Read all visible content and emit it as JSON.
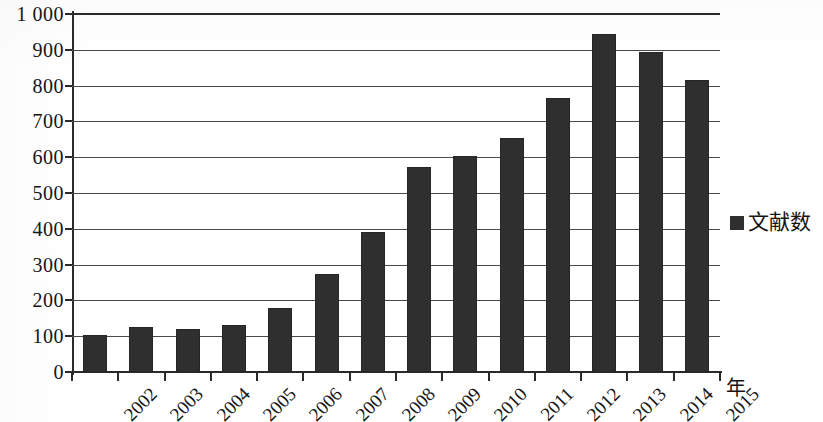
{
  "chart_data": {
    "type": "bar",
    "title": "",
    "subtitle": "",
    "xlabel": "年",
    "ylabel": "",
    "categories": [
      "2002",
      "2003",
      "2004",
      "2005",
      "2006",
      "2007",
      "2008",
      "2009",
      "2010",
      "2011",
      "2012",
      "2013",
      "2014",
      "2015"
    ],
    "values": [
      103,
      127,
      120,
      132,
      180,
      274,
      392,
      574,
      602,
      653,
      765,
      945,
      893,
      815
    ],
    "series": [
      {
        "name": "文献数",
        "values": [
          103,
          127,
          120,
          132,
          180,
          274,
          392,
          574,
          602,
          653,
          765,
          945,
          893,
          815
        ],
        "color": "#302f2f"
      }
    ],
    "ylim": [
      0,
      1000
    ],
    "ytick_step": 100,
    "ytick_labels": [
      "1 000",
      "900",
      "800",
      "700",
      "600",
      "500",
      "400",
      "300",
      "200",
      "100",
      "0"
    ],
    "ytick_values": [
      1000,
      900,
      800,
      700,
      600,
      500,
      400,
      300,
      200,
      100,
      0
    ],
    "grid": true,
    "grid_axis": "y",
    "legend_position": "right",
    "legend_entries": [
      {
        "label": "文献数",
        "marker": "filled-square",
        "color": "#302f2f"
      }
    ],
    "xtick_rotation": -45,
    "bar_color": "#302f2f",
    "background_color": "#ffffff",
    "axis_color": "#2a2a2a"
  }
}
